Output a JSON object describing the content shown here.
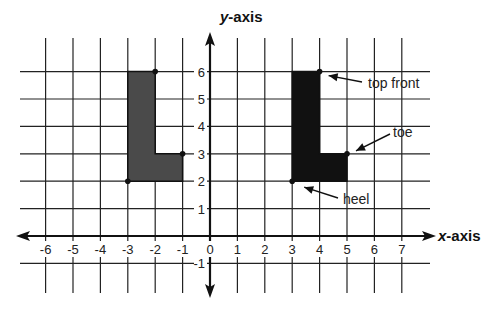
{
  "diagram": {
    "axes": {
      "x_label_italic": "x",
      "x_label_rest": "-axis",
      "y_label_italic": "y",
      "y_label_rest": "-axis",
      "x_ticks": [
        "-6",
        "-5",
        "-4",
        "-3",
        "-2",
        "-1",
        "0",
        "1",
        "2",
        "3",
        "4",
        "5",
        "6",
        "7"
      ],
      "y_ticks": [
        "6",
        "5",
        "4",
        "3",
        "2",
        "1",
        "-1"
      ],
      "x_range": [
        -7,
        8
      ],
      "y_range": [
        -2,
        7
      ]
    },
    "shapes": [
      {
        "name": "original-L",
        "fill": "#4a4a4a",
        "vertices": [
          [
            -3,
            6
          ],
          [
            -2,
            6
          ],
          [
            -2,
            3
          ],
          [
            -1,
            3
          ],
          [
            -1,
            2
          ],
          [
            -3,
            2
          ]
        ],
        "marked_points": [
          [
            -2,
            6
          ],
          [
            -1,
            3
          ],
          [
            -3,
            2
          ]
        ]
      },
      {
        "name": "translated-L",
        "fill": "#111111",
        "vertices": [
          [
            3,
            6
          ],
          [
            4,
            6
          ],
          [
            4,
            3
          ],
          [
            5,
            3
          ],
          [
            5,
            2
          ],
          [
            3,
            2
          ]
        ],
        "marked_points": [
          [
            4,
            6
          ],
          [
            5,
            3
          ],
          [
            3,
            2
          ]
        ]
      }
    ],
    "annotations": [
      {
        "label": "top front",
        "point": [
          4,
          6
        ]
      },
      {
        "label": "toe",
        "point": [
          5,
          3
        ]
      },
      {
        "label": "heel",
        "point": [
          3,
          2
        ]
      }
    ]
  }
}
